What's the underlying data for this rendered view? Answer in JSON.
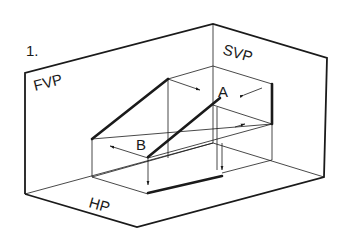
{
  "figure": {
    "number": "1.",
    "planes": {
      "fvp": "FVP",
      "svp": "SVP",
      "hp": "HP"
    },
    "points": {
      "a": "A",
      "b": "B"
    },
    "colors": {
      "ink": "#1a1a1a",
      "background": "#ffffff"
    }
  }
}
